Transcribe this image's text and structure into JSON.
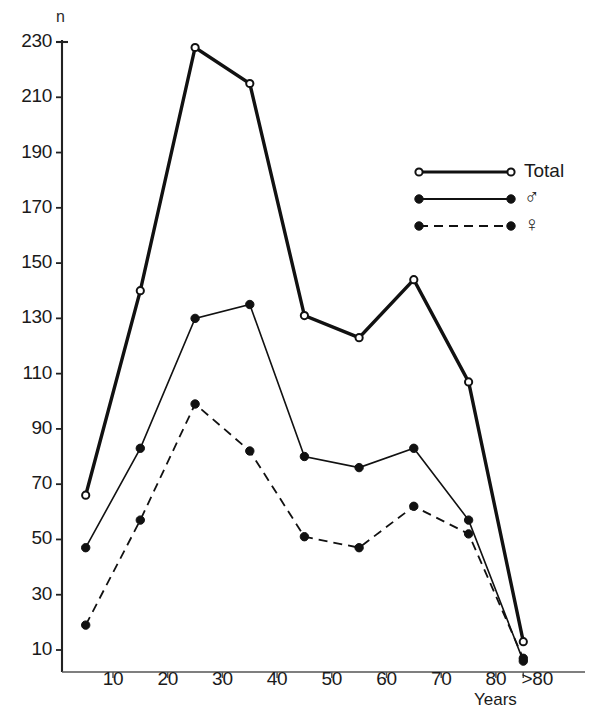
{
  "page": {
    "cut_off_header": "",
    "axis_note": "n"
  },
  "chart_data": {
    "type": "line",
    "title": "",
    "subtitle": "",
    "xlabel": "Years",
    "ylabel": "n",
    "categories": [
      "0-9",
      "10-19",
      "20-29",
      "30-39",
      "40-49",
      "50-59",
      "60-69",
      "70-79",
      ">80"
    ],
    "x": [
      5,
      15,
      25,
      35,
      45,
      55,
      65,
      75,
      85
    ],
    "xtick_labels": [
      "10",
      "20",
      "30",
      "40",
      "50",
      "60",
      "70",
      "80",
      ">80"
    ],
    "xtick_values": [
      10,
      20,
      30,
      40,
      50,
      60,
      70,
      80,
      85
    ],
    "ytick_labels": [
      "230",
      "210",
      "190",
      "170",
      "150",
      "130",
      "110",
      "90",
      "70",
      "50",
      "30",
      "10"
    ],
    "ytick_values": [
      230,
      210,
      190,
      170,
      150,
      130,
      110,
      90,
      70,
      50,
      30,
      10
    ],
    "ylim": [
      0,
      236
    ],
    "xlim": [
      0,
      92
    ],
    "grid": false,
    "legend_position": "upper right",
    "series": [
      {
        "name": "Total",
        "label": "Total",
        "marker": "open-circle",
        "linestyle": "solid",
        "linewidth": 3.4,
        "color": "#111111",
        "values": [
          66,
          140,
          228,
          215,
          131,
          123,
          144,
          107,
          13
        ]
      },
      {
        "name": "male",
        "label": "♂",
        "marker": "filled-circle",
        "linestyle": "solid",
        "linewidth": 1.6,
        "color": "#111111",
        "values": [
          47,
          83,
          130,
          135,
          80,
          76,
          83,
          57,
          6
        ]
      },
      {
        "name": "female",
        "label": "♀",
        "marker": "filled-circle",
        "linestyle": "dashed",
        "linewidth": 1.8,
        "color": "#111111",
        "values": [
          19,
          57,
          99,
          82,
          51,
          47,
          62,
          52,
          7
        ]
      }
    ]
  },
  "legend": {
    "items": [
      {
        "label": "Total",
        "marker": "open-circle",
        "linestyle": "solid"
      },
      {
        "label": "♂",
        "marker": "filled-circle",
        "linestyle": "solid"
      },
      {
        "label": "♀",
        "marker": "filled-circle",
        "linestyle": "dashed"
      }
    ]
  }
}
